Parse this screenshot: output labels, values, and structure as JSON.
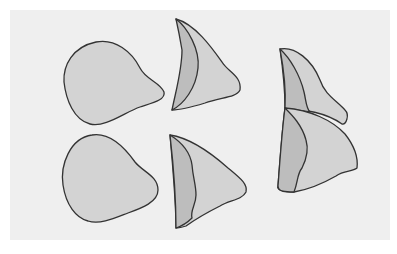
{
  "diagram": {
    "background_color": "#efefef",
    "fill_light": "#d3d3d3",
    "fill_dark": "#bdbdbd",
    "stroke_color": "#333333",
    "shapes": [
      {
        "id": "rounded-blob-top",
        "description": "rounded triangular blob, single face",
        "position": "left-top"
      },
      {
        "id": "rounded-blob-bottom",
        "description": "rounded triangular blob, single face",
        "position": "left-bottom"
      },
      {
        "id": "crescent-shape-top",
        "description": "crescent-like shape with two faces",
        "position": "middle-top"
      },
      {
        "id": "crescent-shape-bottom",
        "description": "crescent-like shape with two faces",
        "position": "middle-bottom"
      },
      {
        "id": "stacked-shape-upper",
        "description": "crescent-like two-face shape, upper of stack",
        "position": "right-top"
      },
      {
        "id": "stacked-shape-lower",
        "description": "crescent-like two-face shape, lower of stack, overlapping",
        "position": "right-bottom"
      }
    ]
  }
}
